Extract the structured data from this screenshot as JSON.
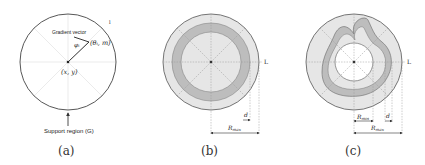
{
  "panels": [
    {
      "id": "a",
      "caption": "(a)",
      "labels": {
        "gradient_vector": "Gradient vector",
        "angle": "φᵢ",
        "point": "(θᵢ, m)",
        "center": "(x, y)",
        "axis_l": "l",
        "support_region": "Support region (G)"
      }
    },
    {
      "id": "b",
      "caption": "(b)",
      "labels": {
        "axis_l": "L",
        "d": "d",
        "r_max": "R",
        "r_max_sub": "max"
      }
    },
    {
      "id": "c",
      "caption": "(c)",
      "labels": {
        "axis_l": "L",
        "d": "d",
        "r_min": "R",
        "r_min_sub": "min",
        "r_max": "R",
        "r_max_sub": "max"
      }
    }
  ],
  "colors": {
    "outer_fill": "#e6e6e6",
    "band_fill": "#bdbdbd",
    "inner_fill": "#ffffff",
    "stroke": "#555555",
    "dash": "#999999"
  }
}
